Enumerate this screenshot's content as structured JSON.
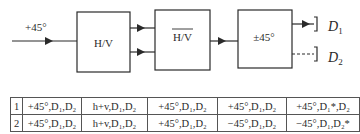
{
  "diagram": {
    "input_label": "+45°",
    "blocks": [
      {
        "id": "hv",
        "label": "H/V"
      },
      {
        "id": "hv_bar",
        "label": "H/V",
        "overline": true
      },
      {
        "id": "pm45",
        "label": "±45°"
      }
    ],
    "detectors": [
      {
        "label": "D",
        "sub": "1",
        "line": "solid"
      },
      {
        "label": "D",
        "sub": "2",
        "line": "dashed"
      }
    ]
  },
  "table": {
    "rows": [
      {
        "index": "1",
        "cells": [
          "+45°,D₁,D₂",
          "h+v,D₁,D₂",
          "+45°,D₁,D₂",
          "+45°,D₁,D₂",
          "+45°,D₁*,D₂"
        ]
      },
      {
        "index": "2",
        "cells": [
          "+45°,D₁,D₂",
          "h+v,D₁,D₂",
          "+45°,D₁,D₂",
          "−45°,D₁,D₂",
          "−45°,D₁,D₂*"
        ]
      }
    ]
  }
}
